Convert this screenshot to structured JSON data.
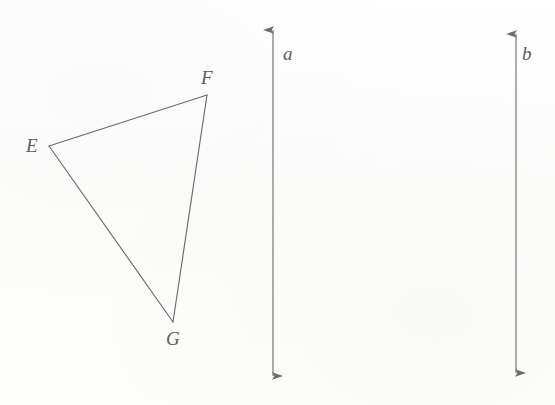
{
  "figure": {
    "background_color": "#fdfdfc",
    "stroke_color": "#6b6b6b",
    "label_color": "#5d5d5d",
    "width": 555,
    "height": 405
  },
  "triangle": {
    "name": "triangle-EFG",
    "vertices": [
      {
        "label": "E",
        "x": 49,
        "y": 146
      },
      {
        "label": "F",
        "x": 207,
        "y": 95
      },
      {
        "label": "G",
        "x": 173,
        "y": 322
      }
    ],
    "edges": [
      {
        "name": "edge-EF",
        "from": "E",
        "to": "F"
      },
      {
        "name": "edge-FG",
        "from": "F",
        "to": "G"
      },
      {
        "name": "edge-GE",
        "from": "G",
        "to": "E"
      }
    ]
  },
  "lines": [
    {
      "label": "a",
      "name": "line-a",
      "orientation": "vertical",
      "x": 273,
      "y_top": 20,
      "y_bottom": 386,
      "arrowheads": "both"
    },
    {
      "label": "b",
      "name": "line-b",
      "orientation": "vertical",
      "x": 516,
      "y_top": 24,
      "y_bottom": 383,
      "arrowheads": "both"
    }
  ],
  "labels": {
    "vertex_E": "E",
    "vertex_F": "F",
    "vertex_G": "G",
    "line_a": "a",
    "line_b": "b"
  }
}
